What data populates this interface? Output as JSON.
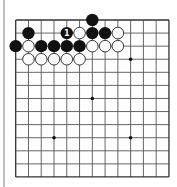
{
  "board": {
    "size": 13,
    "origin_x": 15.7,
    "origin_y": 20,
    "spacing_x": 12.77,
    "spacing_y": 13.08,
    "line_color": "#555555",
    "border_color": "#333333",
    "background": "#ffffff",
    "stone_radius": 6.2,
    "star_points": [
      [
        3,
        3
      ],
      [
        9,
        3
      ],
      [
        6,
        6
      ],
      [
        3,
        9
      ],
      [
        9,
        9
      ]
    ]
  },
  "stones": {
    "black": [
      {
        "col": 6,
        "row": 0
      },
      {
        "col": 1,
        "row": 1
      },
      {
        "col": 4,
        "row": 1,
        "label": "1"
      },
      {
        "col": 6,
        "row": 1
      },
      {
        "col": 7,
        "row": 1
      },
      {
        "col": 0,
        "row": 2
      },
      {
        "col": 2,
        "row": 2
      },
      {
        "col": 3,
        "row": 2
      },
      {
        "col": 4,
        "row": 2
      },
      {
        "col": 5,
        "row": 2
      }
    ],
    "white": [
      {
        "col": 5,
        "row": 1
      },
      {
        "col": 8,
        "row": 1
      },
      {
        "col": 1,
        "row": 2
      },
      {
        "col": 6,
        "row": 2
      },
      {
        "col": 7,
        "row": 2
      },
      {
        "col": 8,
        "row": 2
      },
      {
        "col": 1,
        "row": 3
      },
      {
        "col": 2,
        "row": 3
      },
      {
        "col": 3,
        "row": 3
      },
      {
        "col": 4,
        "row": 3
      },
      {
        "col": 5,
        "row": 3
      }
    ]
  },
  "colors": {
    "black_stone": "#111111",
    "white_stone": "#ffffff",
    "white_stone_outline": "#222222",
    "label_on_black": "#ffffff"
  }
}
